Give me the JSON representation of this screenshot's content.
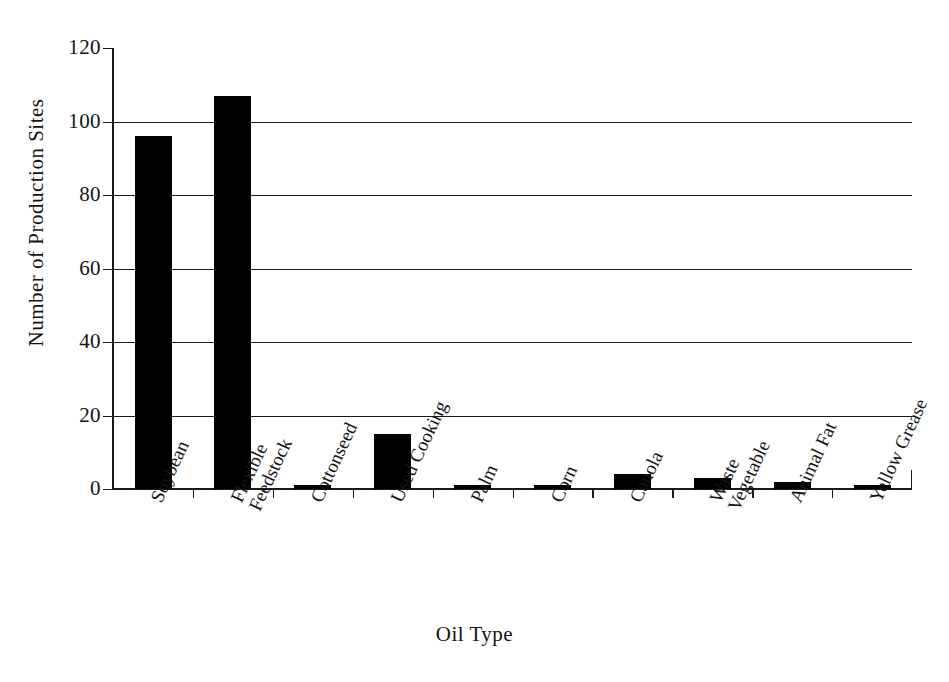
{
  "chart_data": {
    "type": "bar",
    "title": "",
    "xlabel": "Oil Type",
    "ylabel": "Number of Production Sites",
    "categories": [
      "Soybean",
      "Flexible Feedstock",
      "Cottonseed",
      "Used Cooking",
      "Palm",
      "Corn",
      "Canola",
      "Waste Vegetable",
      "Animal Fat",
      "Yellow Grease"
    ],
    "category_lines": [
      [
        "Soybean"
      ],
      [
        "Flexible",
        "Feedstock"
      ],
      [
        "Cottonseed"
      ],
      [
        "Used Cooking"
      ],
      [
        "Palm"
      ],
      [
        "Corn"
      ],
      [
        "Canola"
      ],
      [
        "Waste",
        "Vegetable"
      ],
      [
        "Animal Fat"
      ],
      [
        "Yellow Grease"
      ]
    ],
    "values": [
      96,
      107,
      1,
      15,
      1,
      1,
      4,
      3,
      2,
      1
    ],
    "ylim": [
      0,
      120
    ],
    "ytick_values": [
      0,
      20,
      40,
      60,
      80,
      100,
      120
    ],
    "ytick_labels": [
      "0",
      "20",
      "40",
      "60",
      "80",
      "100",
      "120"
    ],
    "grid": "horizontal",
    "legend": "none",
    "bar_color": "#000000",
    "axis_color": "#1a1a1a",
    "background_color": "#ffffff"
  }
}
